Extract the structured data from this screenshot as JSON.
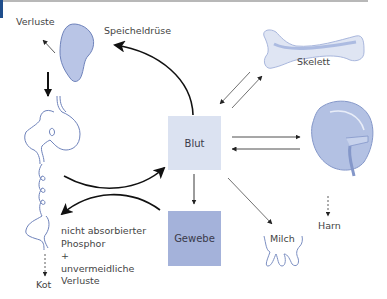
{
  "diagram": {
    "nodes": {
      "blut": "Blut",
      "gewebe": "Gewebe"
    },
    "labels": {
      "verluste_top": "Verluste",
      "speicheldruese": "Speicheldrüse",
      "skelett": "Skelett",
      "harn": "Harn",
      "milch": "Milch",
      "kot": "Kot",
      "fecal_line1": "nicht absorbierter",
      "fecal_line2": "Phosphor",
      "fecal_line3": "+",
      "fecal_line4": "unvermeidliche",
      "fecal_line5": "Verluste"
    },
    "icons": [
      "salivary-gland-icon",
      "digestive-tract-icon",
      "bone-icon",
      "kidney-icon",
      "udder-icon"
    ],
    "colors": {
      "accent": "#1f4e8c",
      "blut_fill": "#dbe2f1",
      "gewebe_fill": "#a4b2da",
      "organ_fill": "#b3c1e3",
      "organ_stroke": "#7c8fc2",
      "arrow": "#111111"
    }
  }
}
